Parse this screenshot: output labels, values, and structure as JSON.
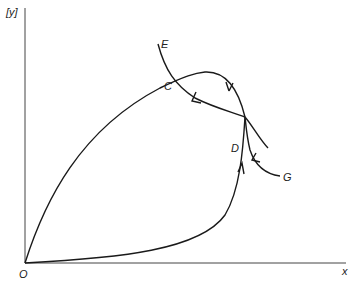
{
  "diagram": {
    "type": "phase-plane trajectory diagram",
    "axes": {
      "y_label": "[y]",
      "x_label": "x",
      "origin_label": "O"
    },
    "points": [
      {
        "id": "O",
        "label": "O"
      },
      {
        "id": "C",
        "label": "C"
      },
      {
        "id": "D",
        "label": "D"
      },
      {
        "id": "E",
        "label": "E"
      },
      {
        "id": "G",
        "label": "G"
      }
    ],
    "curves": [
      {
        "id": "loop-upper",
        "description": "Curve from O rising to C, over the top, down to D"
      },
      {
        "id": "loop-lower",
        "description": "Curve from O along the bottom rising to D with upward arrow"
      },
      {
        "id": "separatrix-E",
        "description": "Curve from E through C to D with arrow pointing toward C"
      },
      {
        "id": "separatrix-G",
        "description": "Curve from G into D with arrow pointing toward D"
      }
    ],
    "colors": {
      "stroke": "#1a1a1a",
      "background": "#ffffff"
    }
  }
}
